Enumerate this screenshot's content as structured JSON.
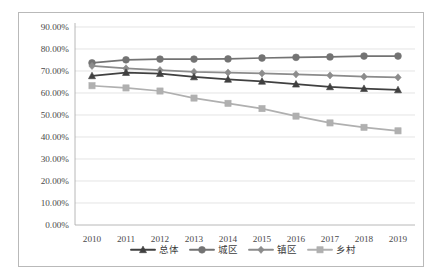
{
  "chart_data": {
    "type": "line",
    "title": "",
    "xlabel": "",
    "ylabel": "",
    "x": [
      2010,
      2011,
      2012,
      2013,
      2014,
      2015,
      2016,
      2017,
      2018,
      2019
    ],
    "categories": [
      "2010",
      "2011",
      "2012",
      "2013",
      "2014",
      "2015",
      "2016",
      "2017",
      "2018",
      "2019"
    ],
    "ylim": [
      0,
      90
    ],
    "ytick_values": [
      0,
      10,
      20,
      30,
      40,
      50,
      60,
      70,
      80,
      90
    ],
    "ytick_labels": [
      "0.00%",
      "10.00%",
      "20.00%",
      "30.00%",
      "40.00%",
      "50.00%",
      "60.00%",
      "70.00%",
      "80.00%",
      "90.00%"
    ],
    "grid": true,
    "legend_position": "bottom",
    "series": [
      {
        "name": "总体",
        "marker": "triangle",
        "color": "#404040",
        "values": [
          67.8,
          69.3,
          68.8,
          67.3,
          66.2,
          65.3,
          64.0,
          62.8,
          62.0,
          61.4
        ]
      },
      {
        "name": "城区",
        "marker": "circle",
        "color": "#737373",
        "values": [
          73.7,
          75.1,
          75.4,
          75.4,
          75.5,
          75.9,
          76.2,
          76.4,
          76.8,
          76.8
        ]
      },
      {
        "name": "镇区",
        "marker": "diamond",
        "color": "#8c8c8c",
        "values": [
          72.3,
          71.2,
          70.4,
          69.6,
          69.3,
          68.9,
          68.5,
          68.0,
          67.4,
          67.1
        ]
      },
      {
        "name": "乡村",
        "marker": "square",
        "color": "#b0b0b0",
        "values": [
          63.3,
          62.3,
          60.9,
          57.7,
          55.3,
          52.9,
          49.5,
          46.4,
          44.4,
          42.8
        ]
      }
    ]
  },
  "legend": {
    "items": [
      {
        "label": "总体"
      },
      {
        "label": "城区"
      },
      {
        "label": "镇区"
      },
      {
        "label": "乡村"
      }
    ]
  },
  "colors": {
    "overall": "#404040",
    "urban": "#737373",
    "town": "#8c8c8c",
    "rural": "#b0b0b0",
    "grid": "#d9d9d9",
    "border": "#b9b9b9",
    "text": "#4a4a4a",
    "background": "#ffffff"
  }
}
